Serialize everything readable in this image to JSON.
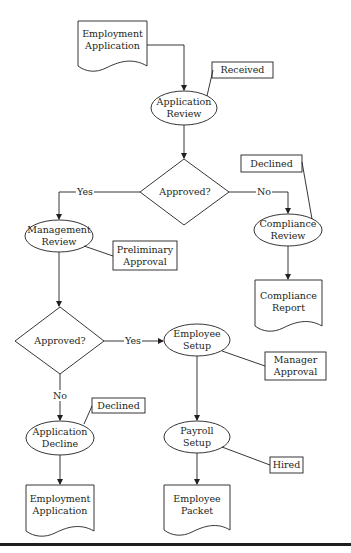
{
  "diagram": {
    "type": "flowchart",
    "colors": {
      "stroke": "#231f20",
      "fill": "#ffffff",
      "rule": "#1e1e1e"
    },
    "nodes": {
      "emp_app_start": {
        "shape": "document",
        "lines": [
          "Employment",
          "Application"
        ]
      },
      "app_review": {
        "shape": "ellipse",
        "lines": [
          "Application",
          "Review"
        ]
      },
      "note_received": {
        "shape": "annotation",
        "lines": [
          "Received"
        ]
      },
      "decision_1": {
        "shape": "diamond",
        "lines": [
          "Approved?"
        ]
      },
      "mgmt_review": {
        "shape": "ellipse",
        "lines": [
          "Management",
          "Review"
        ]
      },
      "note_prelim": {
        "shape": "annotation",
        "lines": [
          "Preliminary",
          "Approval"
        ]
      },
      "compliance_review": {
        "shape": "ellipse",
        "lines": [
          "Compliance",
          "Review"
        ]
      },
      "note_declined_1": {
        "shape": "annotation",
        "lines": [
          "Declined"
        ]
      },
      "compliance_report": {
        "shape": "document",
        "lines": [
          "Compliance",
          "Report"
        ]
      },
      "decision_2": {
        "shape": "diamond",
        "lines": [
          "Approved?"
        ]
      },
      "employee_setup": {
        "shape": "ellipse",
        "lines": [
          "Employee",
          "Setup"
        ]
      },
      "note_mgr_approval": {
        "shape": "annotation",
        "lines": [
          "Manager",
          "Approval"
        ]
      },
      "app_decline": {
        "shape": "ellipse",
        "lines": [
          "Application",
          "Decline"
        ]
      },
      "note_declined_2": {
        "shape": "annotation",
        "lines": [
          "Declined"
        ]
      },
      "payroll_setup": {
        "shape": "ellipse",
        "lines": [
          "Payroll",
          "Setup"
        ]
      },
      "note_hired": {
        "shape": "annotation",
        "lines": [
          "Hired"
        ]
      },
      "emp_app_end": {
        "shape": "document",
        "lines": [
          "Employment",
          "Application"
        ]
      },
      "employee_packet": {
        "shape": "document",
        "lines": [
          "Employee",
          "Packet"
        ]
      }
    },
    "edge_labels": {
      "d1_yes": "Yes",
      "d1_no": "No",
      "d2_yes": "Yes",
      "d2_no": "No"
    },
    "edges": [
      {
        "from": "emp_app_start",
        "to": "app_review"
      },
      {
        "from": "app_review",
        "to": "decision_1"
      },
      {
        "from": "decision_1",
        "to": "mgmt_review",
        "label": "Yes"
      },
      {
        "from": "decision_1",
        "to": "compliance_review",
        "label": "No"
      },
      {
        "from": "compliance_review",
        "to": "compliance_report"
      },
      {
        "from": "mgmt_review",
        "to": "decision_2"
      },
      {
        "from": "decision_2",
        "to": "employee_setup",
        "label": "Yes"
      },
      {
        "from": "decision_2",
        "to": "app_decline",
        "label": "No"
      },
      {
        "from": "employee_setup",
        "to": "payroll_setup"
      },
      {
        "from": "payroll_setup",
        "to": "employee_packet"
      },
      {
        "from": "app_decline",
        "to": "emp_app_end"
      }
    ]
  }
}
